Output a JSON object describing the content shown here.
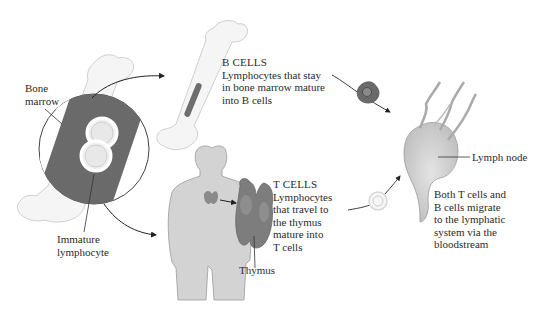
{
  "diagram": {
    "colors": {
      "bone_fill": "#f4f4f4",
      "bone_stroke": "#c9c9c9",
      "marrow": "#6e6e6e",
      "marrow_dark": "#5a5a5a",
      "cell_highlight": "#eeeeee",
      "body_fill": "#d3d3d3",
      "thymus": "#7d7d7d",
      "b_cell": "#6a6a6a",
      "lymph_node": "#cfcfcf",
      "text": "#2a2a2a",
      "arrow": "#222222"
    },
    "labels": {
      "bone_marrow": [
        "Bone",
        "marrow"
      ],
      "immature_lymphocyte": [
        "Immature",
        "lymphocyte"
      ],
      "thymus": "Thymus",
      "lymph_node": "Lymph node"
    },
    "b_cells": {
      "heading": "B CELLS",
      "lines": [
        "Lymphocytes that stay",
        "in bone marrow mature",
        "into B cells"
      ]
    },
    "t_cells": {
      "heading": "T CELLS",
      "lines": [
        "Lymphocytes",
        "that travel to",
        "the thymus",
        "mature into",
        "T cells"
      ]
    },
    "migration": {
      "lines": [
        "Both T cells and",
        "B cells migrate",
        "to the lymphatic",
        "system via the",
        "bloodstream"
      ]
    }
  }
}
